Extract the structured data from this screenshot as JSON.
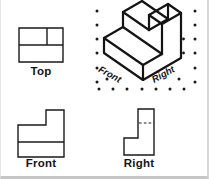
{
  "views": {
    "top": {
      "label": "Top"
    },
    "front": {
      "label": "Front"
    },
    "right": {
      "label": "Right"
    },
    "isometric": {
      "front_edge_label": "Front",
      "right_edge_label": "Right"
    }
  },
  "colors": {
    "background": "#ffffff",
    "line": "#1a1a1a",
    "grid_dot": "#1a1a1a",
    "label_text": "#141414"
  }
}
